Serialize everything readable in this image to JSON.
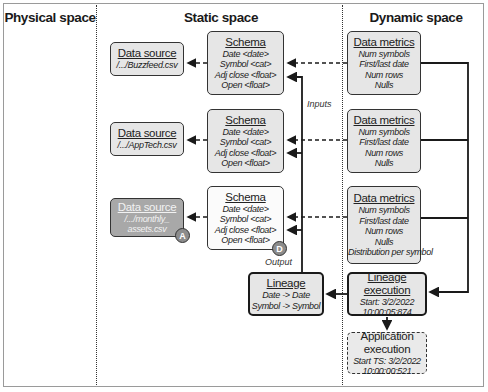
{
  "columns": {
    "physical": {
      "label": "Physical space"
    },
    "static": {
      "label": "Static space"
    },
    "dynamic": {
      "label": "Dynamic space"
    }
  },
  "data_sources": [
    {
      "title": "Data source",
      "path": "/.../Buzzfeed.csv"
    },
    {
      "title": "Data source",
      "path": "/.../AppTech.csv"
    },
    {
      "title": "Data source",
      "path_lines": [
        "/.../monthly_",
        "assets.csv"
      ],
      "badge": "A"
    }
  ],
  "schemas": [
    {
      "title": "Schema",
      "fields": [
        "Date <date>",
        "Symbol <cat>",
        "Adj close <float>",
        "Open <float>"
      ]
    },
    {
      "title": "Schema",
      "fields": [
        "Date <date>",
        "Symbol <cat>",
        "Adj close <float>",
        "Open <float>"
      ]
    },
    {
      "title": "Schema",
      "fields": [
        "Date <date>",
        "Symbol <cat>",
        "Adj close <float>",
        "Open <float>"
      ],
      "badge": "D"
    }
  ],
  "data_metrics": [
    {
      "title": "Data metrics",
      "items": [
        "Num symbols",
        "First/last date",
        "Num rows",
        "Nulls"
      ]
    },
    {
      "title": "Data metrics",
      "items": [
        "Num symbols",
        "First/last date",
        "Num rows",
        "Nulls"
      ]
    },
    {
      "title": "Data metrics",
      "items": [
        "Num symbols",
        "First/last date",
        "Num rows",
        "Nulls",
        "Distribution per symbol"
      ]
    }
  ],
  "lineage": {
    "title": "Lineage",
    "mappings": [
      "Date -> Date",
      "Symbol -> Symbol"
    ]
  },
  "lineage_execution": {
    "title": "Lineage execution",
    "lines": [
      "Start: 3/2/2022",
      "10:00:05:874"
    ]
  },
  "application_execution": {
    "title": "Application execution",
    "lines": [
      "Start TS: 3/2/2022",
      "10:00:00:521"
    ]
  },
  "edge_labels": {
    "inputs": "Inputs",
    "output": "Output"
  },
  "colors": {
    "box_fill": "#e6e6e6",
    "dark_box_fill": "#a8a8a8",
    "badge_fill": "#8c8c8c",
    "stroke": "#1a1a1a"
  }
}
